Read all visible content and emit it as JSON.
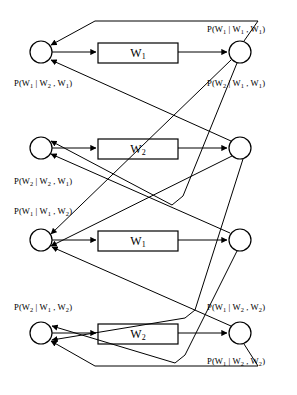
{
  "diagram": {
    "canvas": {
      "width": 297,
      "height": 395
    },
    "stroke_color": "#000000",
    "fill_color": "#ffffff",
    "rows": [
      {
        "id": "row-1",
        "box_label_base": "W",
        "box_label_sub": "1",
        "left_node_cx": 41,
        "right_node_cx": 240,
        "cy": 52,
        "box_x": 98,
        "box_y": 43,
        "box_w": 80,
        "box_h": 20
      },
      {
        "id": "row-2",
        "box_label_base": "W",
        "box_label_sub": "2",
        "left_node_cx": 41,
        "right_node_cx": 240,
        "cy": 148,
        "box_x": 98,
        "box_y": 139,
        "box_w": 80,
        "box_h": 20
      },
      {
        "id": "row-3",
        "box_label_base": "W",
        "box_label_sub": "1",
        "left_node_cx": 41,
        "right_node_cx": 240,
        "cy": 240,
        "box_x": 98,
        "box_y": 231,
        "box_w": 80,
        "box_h": 20
      },
      {
        "id": "row-4",
        "box_label_base": "W",
        "box_label_sub": "2",
        "left_node_cx": 41,
        "right_node_cx": 240,
        "cy": 333,
        "box_x": 98,
        "box_y": 324,
        "box_w": 80,
        "box_h": 20
      }
    ],
    "labels": [
      {
        "id": "label-1",
        "name": "prob-label-p-w1-given-w1-w1",
        "text": "P(W1 | W1 , W1)",
        "parts": [
          "P(W",
          "1",
          " | W",
          "1",
          " , W",
          "1",
          ")"
        ],
        "x": 207,
        "y": 24
      },
      {
        "id": "label-2",
        "name": "prob-label-p-w1-given-w2-w1",
        "text": "P(W1 | W2 , W1)",
        "parts": [
          "P(W",
          "1",
          " | W",
          "2",
          " , W",
          "1",
          ")"
        ],
        "x": 14,
        "y": 78
      },
      {
        "id": "label-3",
        "name": "prob-label-p-w2-given-w1-w1",
        "text": "P(W2 | W1 , W1)",
        "parts": [
          "P(W",
          "2",
          " | W",
          "1",
          " , W",
          "1",
          ")"
        ],
        "x": 207,
        "y": 78
      },
      {
        "id": "label-4",
        "name": "prob-label-p-w2-given-w2-w1",
        "text": "P(W2 | W2 , W1)",
        "parts": [
          "P(W",
          "2",
          " | W",
          "2",
          " , W",
          "1",
          ")"
        ],
        "x": 14,
        "y": 176
      },
      {
        "id": "label-5",
        "name": "prob-label-p-w1-given-w1-w2",
        "text": "P(W1 | W1 , W2)",
        "parts": [
          "P(W",
          "1",
          " | W",
          "1",
          " , W",
          "2",
          ")"
        ],
        "x": 14,
        "y": 206
      },
      {
        "id": "label-6",
        "name": "prob-label-p-w2-given-w1-w2",
        "text": "P(W2 | W1 , W2)",
        "parts": [
          "P(W",
          "2",
          " | W",
          "1",
          " , W",
          "2",
          ")"
        ],
        "x": 14,
        "y": 302
      },
      {
        "id": "label-7",
        "name": "prob-label-p-w1-given-w2-w2-upper",
        "text": "P(W1 | W2 , W2)",
        "parts": [
          "P(W",
          "1",
          " | W",
          "2",
          " , W",
          "2",
          ")"
        ],
        "x": 207,
        "y": 302
      },
      {
        "id": "label-8",
        "name": "prob-label-p-w1-given-w2-w2-lower",
        "text": "P(W1 | W2 , W2)",
        "parts": [
          "P(W",
          "1",
          " | W",
          "2",
          " , W",
          "2",
          ")"
        ],
        "x": 207,
        "y": 356
      }
    ],
    "node_radius": 11,
    "edges": {
      "description": "Directed arcs connecting left state nodes, word boxes, and right state nodes, with cross-row feedback paths"
    }
  }
}
